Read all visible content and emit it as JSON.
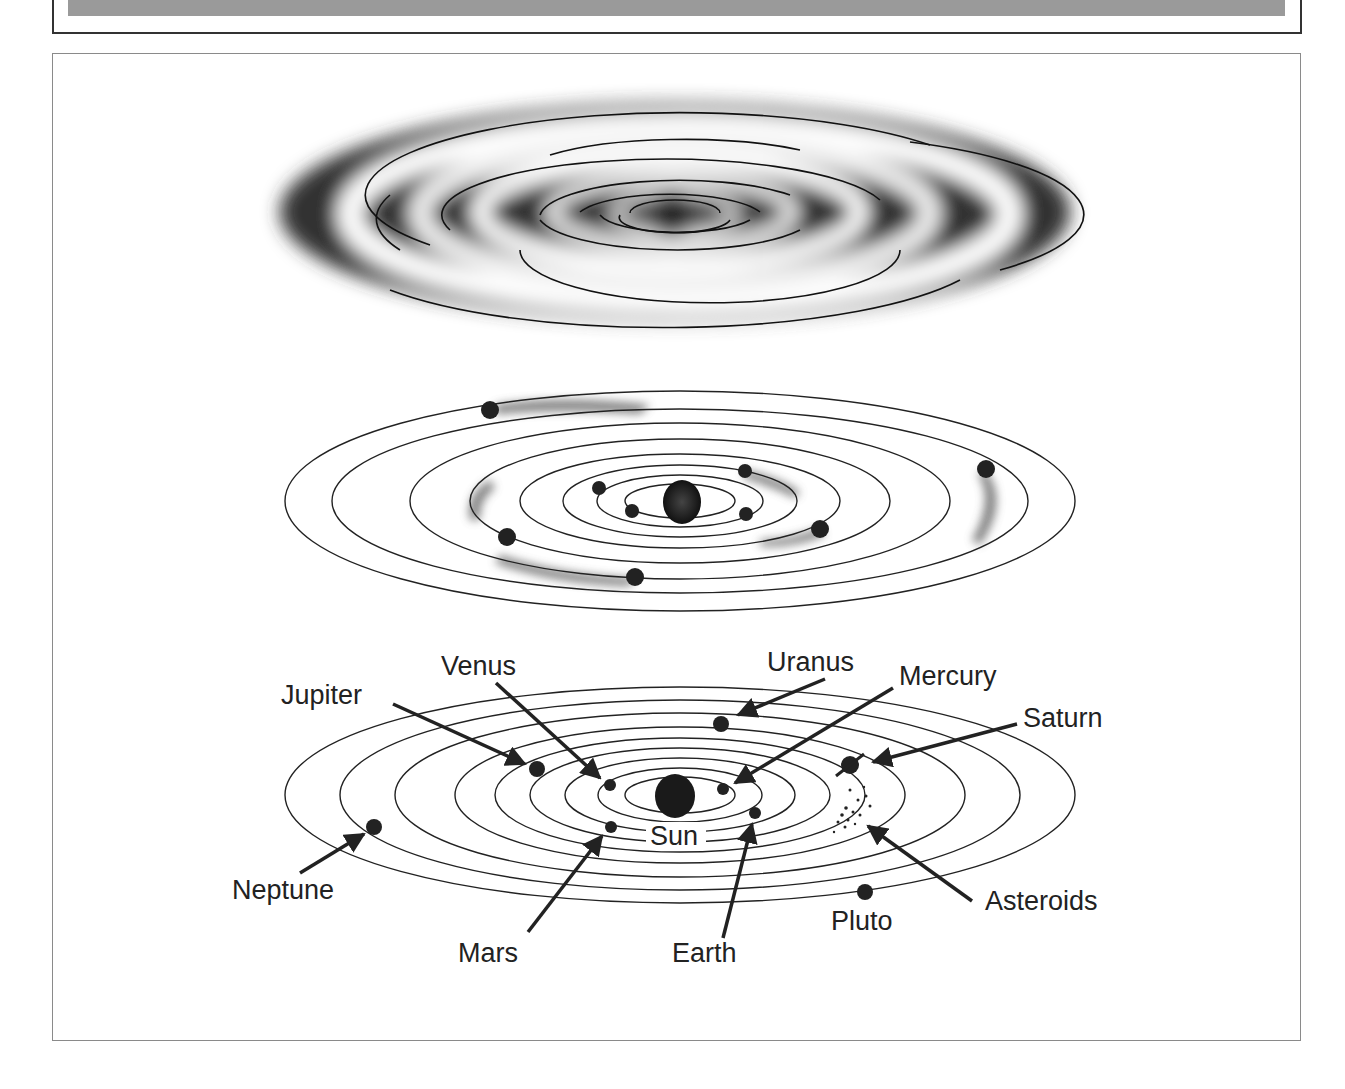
{
  "figure": {
    "panels": [
      {
        "id": "nebula",
        "description": "Rotating disk of gas and dust with spiral bands"
      },
      {
        "id": "condensing",
        "description": "Protoplanets condensing in orbits around central Sun"
      },
      {
        "id": "labeled",
        "description": "Present-day solar system with labeled planets"
      }
    ],
    "labels": {
      "sun": "Sun",
      "mercury": "Mercury",
      "venus": "Venus",
      "earth": "Earth",
      "mars": "Mars",
      "jupiter": "Jupiter",
      "saturn": "Saturn",
      "uranus": "Uranus",
      "neptune": "Neptune",
      "pluto": "Pluto",
      "asteroids": "Asteroids"
    },
    "colors": {
      "ink": "#222222",
      "header_band": "#9a9a9a",
      "frame": "#8a8a8a"
    }
  }
}
